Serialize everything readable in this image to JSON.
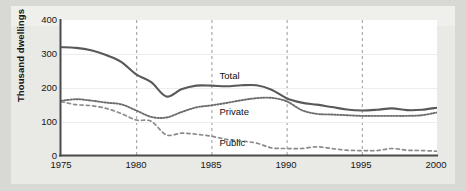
{
  "chart_data": {
    "type": "line",
    "title": "",
    "subtitle": "",
    "xlabel": "",
    "ylabel": "Thousand dwellings",
    "xlim": [
      1975,
      2000
    ],
    "ylim": [
      0,
      400
    ],
    "yticks": [
      0,
      100,
      200,
      300,
      400
    ],
    "xticks": [
      1975,
      1980,
      1985,
      1990,
      1995,
      2000
    ],
    "grid": "vertical dashed gridlines at 1980, 1985, 1990, 1995",
    "legend_position": "inline labels on plot",
    "x": [
      1975,
      1976,
      1977,
      1978,
      1979,
      1980,
      1981,
      1982,
      1983,
      1984,
      1985,
      1986,
      1987,
      1988,
      1989,
      1990,
      1991,
      1992,
      1993,
      1994,
      1995,
      1996,
      1997,
      1998,
      1999,
      2000
    ],
    "series": [
      {
        "name": "Total",
        "style": "solid",
        "color": "#595959",
        "values": [
          320,
          318,
          311,
          297,
          277,
          240,
          217,
          175,
          196,
          207,
          207,
          205,
          208,
          208,
          195,
          170,
          157,
          151,
          144,
          137,
          134,
          136,
          140,
          135,
          136,
          142
        ]
      },
      {
        "name": "Private",
        "style": "dotted",
        "color": "#6e6e6e",
        "values": [
          162,
          167,
          163,
          157,
          152,
          134,
          115,
          113,
          129,
          143,
          149,
          156,
          164,
          170,
          171,
          161,
          135,
          124,
          122,
          120,
          118,
          118,
          118,
          118,
          120,
          128
        ]
      },
      {
        "name": "Public",
        "style": "dashed",
        "color": "#8a8a8a",
        "values": [
          160,
          151,
          148,
          140,
          125,
          106,
          102,
          62,
          67,
          64,
          58,
          49,
          44,
          38,
          24,
          22,
          22,
          27,
          22,
          17,
          16,
          16,
          22,
          17,
          16,
          14
        ]
      }
    ],
    "annotations": [
      {
        "label": "Total",
        "x": 1986.6,
        "y": 236
      },
      {
        "label": "Private",
        "x": 1986.6,
        "y": 130
      },
      {
        "label": "Public",
        "x": 1986.6,
        "y": 37
      }
    ]
  },
  "axes": {
    "y_title": "Thousand dwellings",
    "y_tick_labels": [
      "400",
      "300",
      "200",
      "100",
      "0"
    ],
    "x_tick_labels": [
      "1975",
      "1980",
      "1985",
      "1990",
      "1995",
      "2000"
    ]
  },
  "labels": {
    "total": "Total",
    "private": "Private",
    "public": "Public"
  },
  "colors": {
    "total": "#595959",
    "private": "#6e6e6e",
    "public": "#8a8a8a",
    "axis": "#4a4a4a",
    "grid": "#9a9a9a",
    "plot_bg": "#ffffff",
    "page_bg": "#d8d8d4"
  }
}
